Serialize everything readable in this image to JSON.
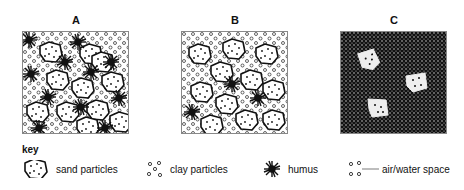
{
  "panels": [
    {
      "label": "A",
      "description": "sand, clay and abundant humus"
    },
    {
      "label": "B",
      "description": "sand and clay with little humus"
    },
    {
      "label": "C",
      "description": "compacted clay with few sand particles"
    }
  ],
  "key": {
    "title": "key",
    "items": [
      {
        "icon": "sand-particle-icon",
        "label": "sand particles"
      },
      {
        "icon": "clay-particles-icon",
        "label": "clay particles"
      },
      {
        "icon": "humus-icon",
        "label": "humus"
      },
      {
        "icon": "air-water-space-icon",
        "label": "air/water space"
      }
    ]
  },
  "colors": {
    "ink": "#111111",
    "border": "#888888",
    "background": "#ffffff"
  }
}
